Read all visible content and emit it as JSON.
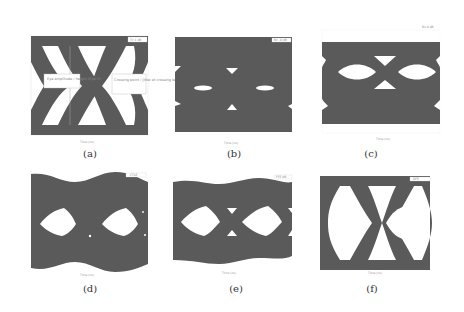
{
  "figure": {
    "style": {
      "trace_color": "#5a5a5a",
      "background": "#ffffff",
      "axis_color": "#cfcfcf",
      "text_color": "#333333"
    },
    "panels": [
      {
        "id": "a",
        "caption": "(a)",
        "legend": "Tx 1 dB",
        "xlabel": "Time (ns)",
        "ylabel": "Amplitude (V)",
        "annotations": [
          "Eye amplitude / height (Eye H)",
          "Crossing point / jitter at crossing level"
        ]
      },
      {
        "id": "b",
        "caption": "(b)",
        "legend": "Rx -8 dB",
        "xlabel": "Time (ns)",
        "ylabel": "Amplitude (V)"
      },
      {
        "id": "c",
        "caption": "(c)",
        "legend": "Rx 8 dB",
        "xlabel": "Time (ns)",
        "ylabel": "Amplitude (V)"
      },
      {
        "id": "d",
        "caption": "(d)",
        "legend": "CTLE",
        "xlabel": "Time (ns)",
        "ylabel": "Amplitude (V)"
      },
      {
        "id": "e",
        "caption": "(e)",
        "legend": "FFE dB",
        "xlabel": "Time (ns)",
        "ylabel": "Amplitude (V)"
      },
      {
        "id": "f",
        "caption": "(f)",
        "legend": "DFE",
        "xlabel": "Time (ns)",
        "ylabel": "Amplitude (V)"
      }
    ]
  }
}
